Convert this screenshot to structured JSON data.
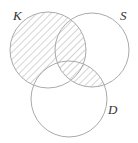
{
  "diagram": {
    "type": "venn",
    "sets": [
      {
        "id": "K",
        "label": "K",
        "cx": 48,
        "cy": 50,
        "r": 38
      },
      {
        "id": "S",
        "label": "S",
        "cx": 92,
        "cy": 50,
        "r": 37
      },
      {
        "id": "D",
        "label": "D",
        "cx": 69,
        "cy": 99,
        "r": 38
      }
    ],
    "shaded_regions": [
      "K only",
      "K∩S not D",
      "K∩S∩D",
      "S∩D not K"
    ],
    "unshaded_regions": [
      "K∩D not S",
      "S only",
      "D only"
    ],
    "colors": {
      "stroke": "#aaaaaa",
      "hatch": "#b0b0b0",
      "label": "#333333"
    }
  },
  "labels": {
    "K": "K",
    "S": "S",
    "D": "D"
  }
}
